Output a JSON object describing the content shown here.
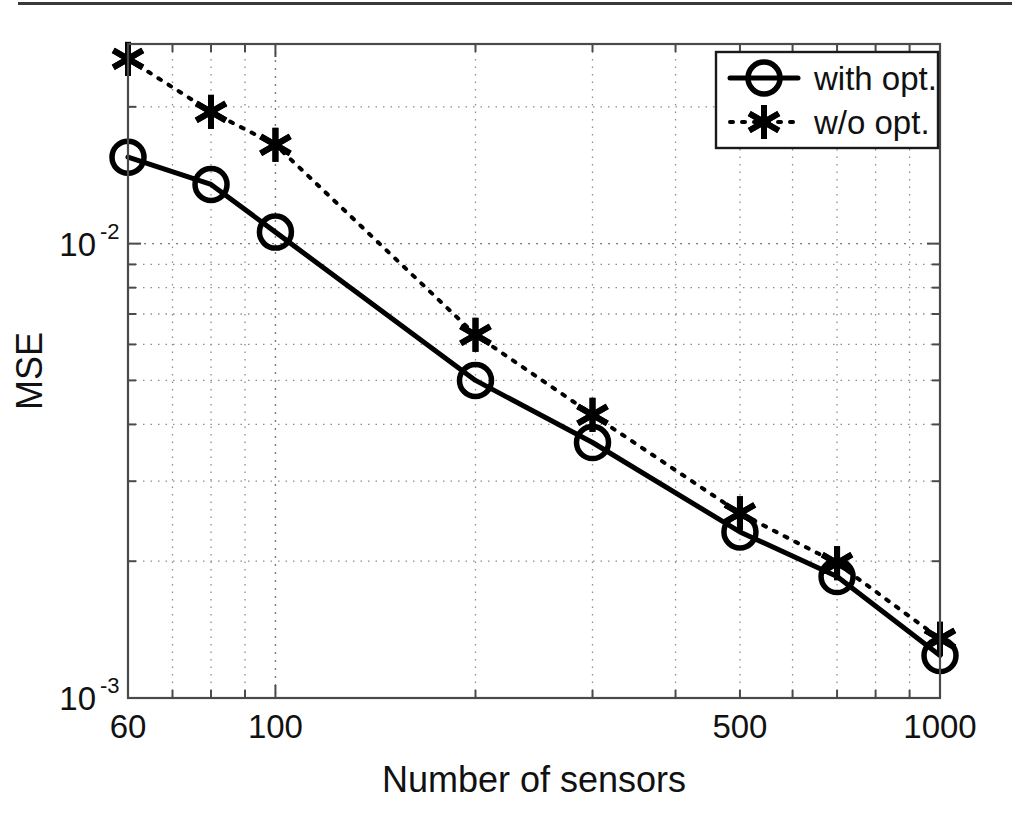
{
  "chart_data": {
    "type": "line",
    "title": "",
    "xlabel": "Number of sensors",
    "ylabel": "MSE",
    "xscale": "log",
    "yscale": "log",
    "xlim": [
      60,
      1000
    ],
    "ylim": [
      0.001,
      0.0275
    ],
    "grid": true,
    "legend_position": "top-right",
    "x": [
      60,
      80,
      100,
      200,
      300,
      500,
      700,
      1000
    ],
    "xtick_labels": [
      "60",
      "100",
      "500",
      "1000"
    ],
    "xtick_values": [
      60,
      100,
      500,
      1000
    ],
    "ytick_labels": [
      "10^-2",
      "10^-3"
    ],
    "ytick_values": [
      0.01,
      0.001
    ],
    "ytick_base": "10",
    "ytick_exp_upper": "-2",
    "ytick_exp_lower": "-3",
    "series": [
      {
        "name": "with opt.",
        "marker": "circle",
        "linestyle": "solid",
        "color": "#000000",
        "values": [
          0.0155,
          0.0135,
          0.0106,
          0.005,
          0.00365,
          0.00232,
          0.00185,
          0.00124
        ]
      },
      {
        "name": "w/o opt.",
        "marker": "asterisk",
        "linestyle": "dotted",
        "color": "#000000",
        "values": [
          0.0255,
          0.0195,
          0.0165,
          0.0063,
          0.0042,
          0.00255,
          0.00198,
          0.00135
        ]
      }
    ]
  },
  "legend": {
    "entries": [
      {
        "label": "with opt."
      },
      {
        "label": "w/o opt."
      }
    ]
  },
  "axes": {
    "x_title": "Number of sensors",
    "y_title": "MSE"
  }
}
